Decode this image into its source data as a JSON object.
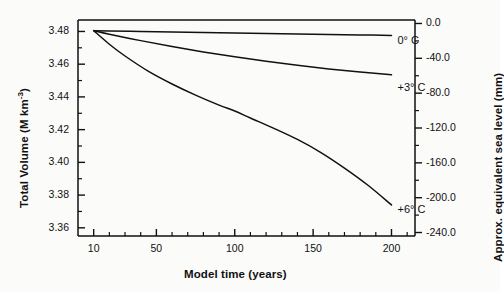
{
  "chart_data": {
    "type": "line",
    "title": "",
    "xlabel": "Model time (years)",
    "ylabel": "Total Volume (M km<sup>-3</sup>)",
    "ylabel_plain": "Total Volume (M km-3)",
    "y2label": "Approx. equivalent sea level (mm)",
    "xlim": [
      0,
      215
    ],
    "ylim": [
      3.355,
      3.487
    ],
    "y2lim": [
      -244,
      4
    ],
    "grid": false,
    "legend_position": "inline-right-of-curve-ends",
    "x_ticks_major": [
      10,
      50,
      100,
      150,
      200
    ],
    "x_tick_labels": [
      "10",
      "50",
      "100",
      "150",
      "200"
    ],
    "x_ticks_minor": [
      20,
      30,
      40,
      60,
      70,
      80,
      90,
      110,
      120,
      130,
      140,
      160,
      170,
      180,
      190,
      210
    ],
    "y_ticks_major": [
      3.36,
      3.38,
      3.4,
      3.42,
      3.44,
      3.46,
      3.48
    ],
    "y_tick_labels": [
      "3.36",
      "3.38",
      "3.40",
      "3.42",
      "3.44",
      "3.46",
      "3.48"
    ],
    "y_ticks_minor": [
      3.37,
      3.39,
      3.41,
      3.43,
      3.45,
      3.47
    ],
    "y2_ticks_major": [
      0.0,
      -40.0,
      -80.0,
      -120.0,
      -160.0,
      -200.0,
      -240.0
    ],
    "y2_tick_labels": [
      "0.0",
      "-40.0",
      "-80.0",
      "-120.0",
      "-160.0",
      "-200.0",
      "-240.0"
    ],
    "y2_ticks_minor": [
      -20,
      -60,
      -100,
      -140,
      -180,
      -220
    ],
    "series": [
      {
        "name": "0° C",
        "label": "0° C",
        "color": "#111111",
        "x": [
          10,
          20,
          40,
          60,
          80,
          100,
          120,
          140,
          160,
          180,
          200
        ],
        "values": [
          3.4805,
          3.4803,
          3.48,
          3.4797,
          3.4794,
          3.4791,
          3.4788,
          3.4785,
          3.4782,
          3.4779,
          3.4776
        ]
      },
      {
        "name": "+3° C",
        "label": "+3° C",
        "color": "#111111",
        "x": [
          10,
          20,
          40,
          60,
          80,
          100,
          120,
          140,
          160,
          180,
          200
        ],
        "values": [
          3.4805,
          3.4783,
          3.4744,
          3.4708,
          3.4675,
          3.4645,
          3.4618,
          3.4593,
          3.4571,
          3.4552,
          3.4535
        ]
      },
      {
        "name": "+6° C",
        "label": "+6° C",
        "color": "#111111",
        "x": [
          10,
          20,
          30,
          45,
          60,
          75,
          90,
          100,
          110,
          125,
          140,
          155,
          170,
          185,
          200
        ],
        "values": [
          3.4805,
          3.4722,
          3.465,
          3.4556,
          3.4479,
          3.4411,
          3.435,
          3.4314,
          3.4271,
          3.4208,
          3.414,
          3.406,
          3.3965,
          3.386,
          3.374
        ]
      }
    ]
  },
  "axes": {
    "y_left_title": "Total Volume (M km",
    "y_left_exp": "-3",
    "y_left_close": ")",
    "y_right_title": "Approx. equivalent sea level (mm)",
    "x_title": "Model time (years)"
  }
}
